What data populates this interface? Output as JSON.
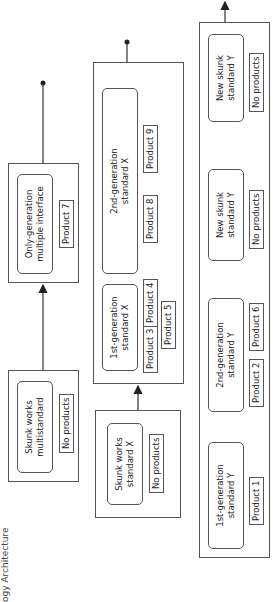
{
  "caption": "ogy Architecture",
  "lanes": [
    {
      "name": "multistandard",
      "groups": [
        {
          "node": "Skunk works\nmultistandard",
          "products": [
            "No products"
          ]
        },
        {
          "node": "Only-generation\nmultiple interface",
          "products": [
            "Product 7"
          ]
        }
      ]
    },
    {
      "name": "standard-x",
      "groups": [
        {
          "node": "Skunk works\nstandard X",
          "products": [
            "No products"
          ]
        },
        {
          "nodes": [
            {
              "node": "1st-generation\nstandard X",
              "products": [
                "Product 3",
                "Product 4",
                "Product 5"
              ]
            },
            {
              "node": "2nd-generation\nstandard X",
              "products": [
                "Product 8",
                "Product 9"
              ]
            }
          ]
        }
      ]
    },
    {
      "name": "standard-y",
      "groups": [
        {
          "nodes": [
            {
              "node": "1st-generation\nstandard Y",
              "products": [
                "Product 1"
              ]
            },
            {
              "node": "2nd-generation\nstandard Y",
              "products": [
                "Product 2",
                "Product 6"
              ]
            },
            {
              "node": "New skunk\nstandard Y",
              "products": [
                "No products"
              ]
            },
            {
              "node": "New skunk\nstandard Y",
              "products": [
                "No products"
              ]
            }
          ]
        }
      ]
    }
  ]
}
